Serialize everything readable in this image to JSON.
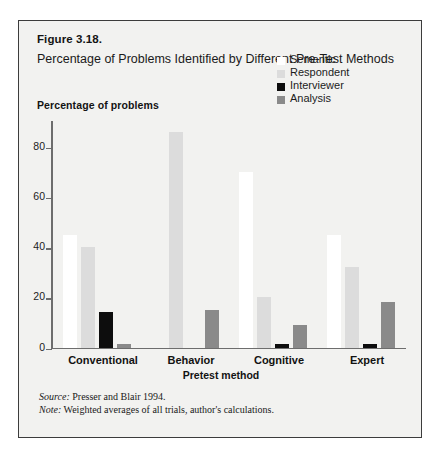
{
  "figure": {
    "number": "Figure 3.18.",
    "title": "Percentage of Problems Identified by Different Pre-Test Methods"
  },
  "axis": {
    "y_title": "Percentage of problems",
    "x_title": "Pretest method",
    "y_ticks": [
      "80",
      "60",
      "40",
      "20",
      "0"
    ]
  },
  "legend": {
    "items": [
      {
        "label": "Semantic",
        "color": "#ffffff"
      },
      {
        "label": "Respondent",
        "color": "#dcdcdc"
      },
      {
        "label": "Interviewer",
        "color": "#0d0d0d"
      },
      {
        "label": "Analysis",
        "color": "#8a8a8a"
      }
    ]
  },
  "notes": {
    "source_key": "Source:",
    "source_text": " Presser and Blair 1994.",
    "note_key": "Note:",
    "note_text": " Weighted averages of all trials, author's calculations."
  },
  "chart_data": {
    "type": "bar",
    "title": "Percentage of Problems Identified by Different Pre-Test Methods",
    "xlabel": "Pretest method",
    "ylabel": "Percentage of problems",
    "ylim": [
      0,
      90
    ],
    "yticks": [
      0,
      20,
      40,
      60,
      80
    ],
    "grid": false,
    "legend_position": "top-right",
    "categories": [
      "Conventional",
      "Behavior",
      "Cognitive",
      "Expert"
    ],
    "series": [
      {
        "name": "Semantic",
        "color": "#ffffff",
        "values": [
          45,
          0,
          70,
          45
        ]
      },
      {
        "name": "Respondent",
        "color": "#dcdcdc",
        "values": [
          40,
          86,
          20,
          32
        ]
      },
      {
        "name": "Interviewer",
        "color": "#0d0d0d",
        "values": [
          14,
          0,
          1.5,
          1.5
        ]
      },
      {
        "name": "Analysis",
        "color": "#8a8a8a",
        "values": [
          1.5,
          15,
          9,
          18
        ]
      }
    ]
  }
}
